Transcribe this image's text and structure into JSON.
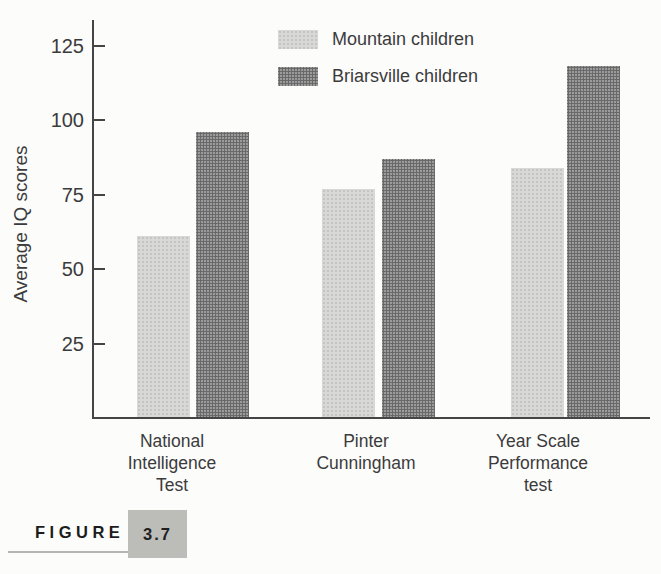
{
  "figure": {
    "kicker": "FIGURE",
    "number": "3.7"
  },
  "chart_data": {
    "type": "bar",
    "title": "",
    "xlabel": "",
    "ylabel": "Average IQ scores",
    "categories": [
      "National Intelligence Test",
      "Pinter Cunningham",
      "Year Scale Performance test"
    ],
    "category_lines": [
      [
        "National",
        "Intelligence",
        "Test"
      ],
      [
        "Pinter",
        "Cunningham"
      ],
      [
        "Year Scale",
        "Performance",
        "test"
      ]
    ],
    "series": [
      {
        "name": "Mountain children",
        "values": [
          61,
          77,
          84
        ],
        "color": "#d8d8d6"
      },
      {
        "name": "Briarsville children",
        "values": [
          96,
          87,
          118
        ],
        "color": "#8e8e8e"
      }
    ],
    "yticks": [
      25,
      50,
      75,
      100,
      125
    ],
    "ylim": [
      0,
      133
    ],
    "grid": false,
    "legend_position": "top-right"
  }
}
